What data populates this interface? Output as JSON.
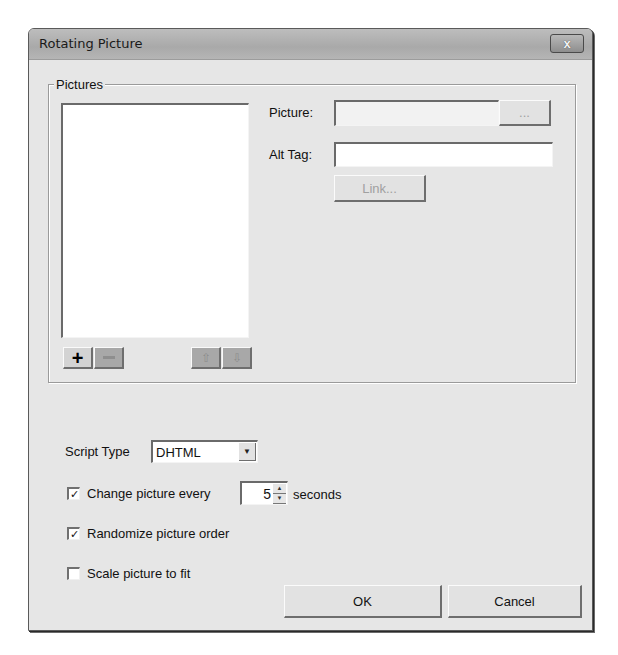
{
  "window": {
    "title": "Rotating Picture",
    "close_label": "x"
  },
  "pictures_group": {
    "label": "Pictures",
    "list_items": [],
    "toolbar": {
      "add_label": "+",
      "remove_label": "",
      "move_up_label": "⇧",
      "move_down_label": "⇩"
    },
    "picture_label": "Picture:",
    "picture_value": "",
    "browse_label": "...",
    "alt_tag_label": "Alt Tag:",
    "alt_tag_value": "",
    "link_label": "Link..."
  },
  "options": {
    "script_type_label": "Script Type",
    "script_type_value": "DHTML",
    "change_every": {
      "label": "Change picture every",
      "checked": true,
      "value": "5",
      "unit": "seconds"
    },
    "randomize": {
      "label": "Randomize picture order",
      "checked": true
    },
    "scale": {
      "label": "Scale picture to fit",
      "checked": false
    },
    "check_glyph": "✓"
  },
  "footer": {
    "ok_label": "OK",
    "cancel_label": "Cancel"
  }
}
